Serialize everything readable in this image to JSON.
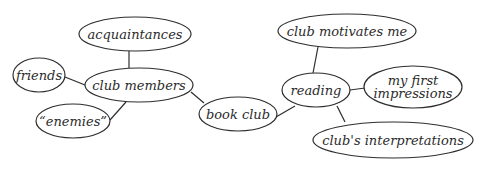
{
  "diagram": {
    "type": "mind-map",
    "style": {
      "stroke": "#2e2e2e",
      "background": "#ffffff",
      "text": "#2b2b2b"
    },
    "nodes": [
      {
        "id": "acquaintances",
        "label": "acquaintances",
        "cx": 135,
        "cy": 34,
        "rx": 56,
        "ry": 17
      },
      {
        "id": "club-members",
        "label": "club members",
        "cx": 139,
        "cy": 85,
        "rx": 54,
        "ry": 17
      },
      {
        "id": "friends",
        "label": "friends",
        "cx": 39,
        "cy": 75,
        "rx": 26,
        "ry": 17
      },
      {
        "id": "enemies",
        "label": "“enemies”",
        "cx": 73,
        "cy": 121,
        "rx": 37,
        "ry": 17
      },
      {
        "id": "book-club",
        "label": "book club",
        "cx": 238,
        "cy": 114,
        "rx": 39,
        "ry": 17
      },
      {
        "id": "reading",
        "label": "reading",
        "cx": 316,
        "cy": 90,
        "rx": 34,
        "ry": 17
      },
      {
        "id": "club-motivates-me",
        "label": "club motivates me",
        "cx": 347,
        "cy": 31,
        "rx": 69,
        "ry": 17
      },
      {
        "id": "my-first-impressions",
        "label": "my first\nimpressions",
        "cx": 413,
        "cy": 87,
        "rx": 49,
        "ry": 21
      },
      {
        "id": "clubs-interpretations",
        "label": "club's interpretations",
        "cx": 393,
        "cy": 140,
        "rx": 80,
        "ry": 18
      }
    ],
    "edges": [
      {
        "from": "acquaintances",
        "to": "club-members",
        "x1": 129,
        "y1": 51,
        "x2": 129,
        "y2": 68
      },
      {
        "from": "friends",
        "to": "club-members",
        "x1": 65,
        "y1": 77,
        "x2": 85,
        "y2": 85
      },
      {
        "from": "enemies",
        "to": "club-members",
        "x1": 110,
        "y1": 120,
        "x2": 126,
        "y2": 102
      },
      {
        "from": "club-members",
        "to": "book-club",
        "x1": 191,
        "y1": 92,
        "x2": 204,
        "y2": 103
      },
      {
        "from": "book-club",
        "to": "reading",
        "x1": 276,
        "y1": 117,
        "x2": 295,
        "y2": 106
      },
      {
        "from": "reading",
        "to": "club-motivates-me",
        "x1": 313,
        "y1": 73,
        "x2": 318,
        "y2": 47
      },
      {
        "from": "reading",
        "to": "my-first-impressions",
        "x1": 350,
        "y1": 90,
        "x2": 365,
        "y2": 88
      },
      {
        "from": "reading",
        "to": "clubs-interpretations",
        "x1": 337,
        "y1": 106,
        "x2": 345,
        "y2": 122
      }
    ]
  }
}
